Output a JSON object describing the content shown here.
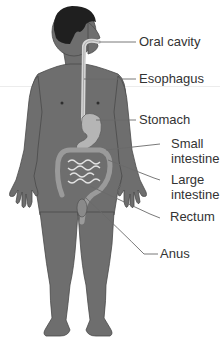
{
  "diagram": {
    "colors": {
      "body": "#6e6e6e",
      "body_outline": "#4a4a4a",
      "hair": "#1f1f1f",
      "organ": "#b5b5b5",
      "leader_line": "#6a6a6a",
      "label_text": "#333333"
    },
    "labels": [
      {
        "id": "oral-cavity",
        "text": "Oral cavity"
      },
      {
        "id": "esophagus",
        "text": "Esophagus"
      },
      {
        "id": "stomach",
        "text": "Stomach"
      },
      {
        "id": "small-intestine",
        "text": "Small\nintestine"
      },
      {
        "id": "large-intestine",
        "text": "Large\nintestine"
      },
      {
        "id": "rectum",
        "text": "Rectum"
      },
      {
        "id": "anus",
        "text": "Anus"
      }
    ]
  }
}
